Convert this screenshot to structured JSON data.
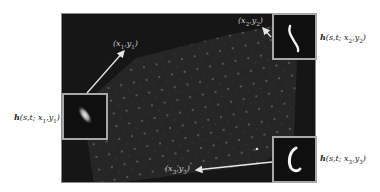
{
  "figure": {
    "background_color": "#ffffff",
    "image_background_color": "#161616",
    "inset_border_color": "#a8a8a8",
    "arrow_color": "#e6e6e6"
  },
  "coordinates": [
    {
      "id": "p1",
      "label_html": "(x<sub>1</sub>,y<sub>1</sub>)",
      "text": "(x1,y1)"
    },
    {
      "id": "p2",
      "label_html": "(x<sub>2</sub>,y<sub>2</sub>)",
      "text": "(x2,y2)"
    },
    {
      "id": "p3",
      "label_html": "(x<sub>3</sub>,y<sub>3</sub>)",
      "text": "(x3,y3)"
    }
  ],
  "psf_labels": [
    {
      "id": "h1",
      "fn": "h",
      "args_html": "(s,t; x<sub>1</sub>,y<sub>1</sub>)",
      "text": "h(s,t; x1,y1)"
    },
    {
      "id": "h2",
      "fn": "h",
      "args_html": "(s,t; x<sub>2</sub>,y<sub>2</sub>)",
      "text": "h(s,t; x2,y2)"
    },
    {
      "id": "h3",
      "fn": "h",
      "args_html": "(s,t; x<sub>3</sub>,y<sub>3</sub>)",
      "text": "h(s,t; x3,y3)"
    }
  ],
  "insets": [
    {
      "id": "inset-1",
      "psf_shape": "diagonal-blob"
    },
    {
      "id": "inset-2",
      "psf_shape": "s-curve-streak"
    },
    {
      "id": "inset-3",
      "psf_shape": "c-curve"
    }
  ]
}
